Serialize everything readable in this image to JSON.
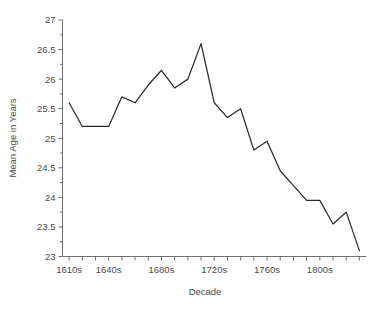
{
  "chart_data": {
    "type": "line",
    "title": "",
    "xlabel": "Decade",
    "ylabel": "Mean Age in Years",
    "ylim": [
      23,
      27
    ],
    "ytick_labels": [
      "23",
      "23.5",
      "24",
      "24.5",
      "25",
      "25.5",
      "26",
      "26.5",
      "27"
    ],
    "ytick_values": [
      23,
      23.5,
      24,
      24.5,
      25,
      25.5,
      26,
      26.5,
      27
    ],
    "xtick_labels": [
      "1610s",
      "1640s",
      "1680s",
      "1720s",
      "1760s",
      "1800s"
    ],
    "xtick_values": [
      1610,
      1640,
      1680,
      1720,
      1760,
      1800
    ],
    "xlim": [
      1605,
      1835
    ],
    "grid": false,
    "legend": false,
    "categories": [
      "1610s",
      "1620s",
      "1630s",
      "1640s",
      "1650s",
      "1660s",
      "1670s",
      "1680s",
      "1690s",
      "1700s",
      "1710s",
      "1720s",
      "1730s",
      "1740s",
      "1750s",
      "1760s",
      "1770s",
      "1780s",
      "1790s",
      "1800s",
      "1810s",
      "1820s"
    ],
    "values": [
      25.6,
      25.2,
      25.2,
      25.2,
      25.7,
      25.6,
      25.9,
      26.15,
      25.85,
      26.0,
      26.6,
      25.6,
      25.35,
      25.5,
      24.8,
      24.95,
      24.45,
      24.2,
      23.95,
      23.95,
      23.55,
      23.75
    ],
    "series": [
      {
        "name": "Mean Age in Years",
        "points": [
          {
            "x": 1610,
            "y": 25.6
          },
          {
            "x": 1620,
            "y": 25.2
          },
          {
            "x": 1630,
            "y": 25.2
          },
          {
            "x": 1640,
            "y": 25.2
          },
          {
            "x": 1650,
            "y": 25.7
          },
          {
            "x": 1660,
            "y": 25.6
          },
          {
            "x": 1670,
            "y": 25.9
          },
          {
            "x": 1680,
            "y": 26.15
          },
          {
            "x": 1690,
            "y": 25.85
          },
          {
            "x": 1700,
            "y": 26.0
          },
          {
            "x": 1710,
            "y": 26.6
          },
          {
            "x": 1720,
            "y": 25.6
          },
          {
            "x": 1730,
            "y": 25.35
          },
          {
            "x": 1740,
            "y": 25.5
          },
          {
            "x": 1750,
            "y": 24.8
          },
          {
            "x": 1760,
            "y": 24.95
          },
          {
            "x": 1770,
            "y": 24.45
          },
          {
            "x": 1780,
            "y": 24.2
          },
          {
            "x": 1790,
            "y": 23.95
          },
          {
            "x": 1800,
            "y": 23.95
          },
          {
            "x": 1810,
            "y": 23.55
          },
          {
            "x": 1820,
            "y": 23.75
          },
          {
            "x": 1830,
            "y": 23.1
          }
        ]
      }
    ],
    "colors": {
      "line": "#2b2b2b",
      "axis": "#6e6e6e",
      "text": "#4a4a4a",
      "background": "#ffffff"
    }
  }
}
